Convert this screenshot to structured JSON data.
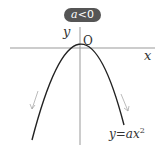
{
  "badge": {
    "var": "a",
    "rest": "<0"
  },
  "axes": {
    "x_label": "x",
    "y_label": "y",
    "origin_label": "O"
  },
  "curve": {
    "label_lhs": "y",
    "label_eq": "=",
    "label_coef": "a",
    "label_var": "x",
    "label_exp": "2"
  },
  "colors": {
    "badge_bg": "#555555",
    "curve": "#222222",
    "axis": "#999999",
    "arrow": "#aaaaaa"
  }
}
